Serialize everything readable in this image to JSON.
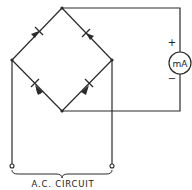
{
  "diagram": {
    "type": "bridge-rectifier-circuit",
    "meter": {
      "label": "mA",
      "positive_sign": "+",
      "negative_sign": "−"
    },
    "caption": "A.C. CIRCUIT",
    "colors": {
      "line": "#2a2a2a",
      "background": "#ffffff"
    },
    "diodes": [
      {
        "position": "top-left",
        "direction": "toward-top"
      },
      {
        "position": "top-right",
        "direction": "toward-top"
      },
      {
        "position": "bottom-left",
        "direction": "toward-left"
      },
      {
        "position": "bottom-right",
        "direction": "toward-right"
      }
    ]
  }
}
